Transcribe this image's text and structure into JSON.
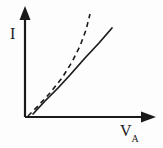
{
  "figure": {
    "background_color": "#fdfdfd",
    "stroke_color": "#1a1a1a",
    "y_axis_label": "I",
    "x_axis_label_main": "V",
    "x_axis_label_sub": "A"
  },
  "chart_data": {
    "type": "line",
    "title": "",
    "xlabel": "V_A",
    "ylabel": "I",
    "grid": false,
    "legend": "none",
    "axes": {
      "origin_px": [
        25,
        117
      ],
      "y_axis_top_px": [
        25,
        8
      ],
      "x_axis_right_px": [
        155,
        117
      ],
      "y_arrow": true,
      "x_arrow": true,
      "ticks": [],
      "tick_labels": []
    },
    "series": [
      {
        "name": "measured characteristic",
        "style": "solid",
        "color": "#1a1a1a",
        "points_px": [
          [
            33,
            114
          ],
          [
            45,
            101
          ],
          [
            58,
            88
          ],
          [
            70,
            75
          ],
          [
            85,
            58
          ],
          [
            99,
            43
          ],
          [
            112,
            28
          ]
        ]
      },
      {
        "name": "ideal characteristic",
        "style": "dashed",
        "color": "#1a1a1a",
        "points_px": [
          [
            28,
            116
          ],
          [
            38,
            106
          ],
          [
            50,
            93
          ],
          [
            62,
            78
          ],
          [
            72,
            62
          ],
          [
            80,
            46
          ],
          [
            86,
            30
          ],
          [
            90,
            14
          ]
        ]
      }
    ],
    "xlim": [
      0,
      1
    ],
    "ylim": [
      0,
      1
    ]
  }
}
